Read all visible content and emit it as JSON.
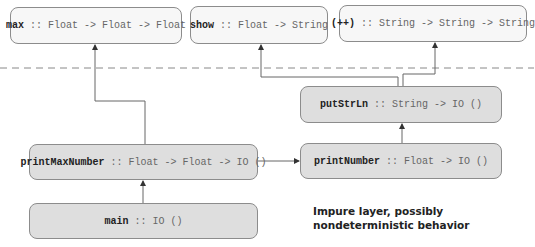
{
  "pure_layer": {
    "functions": [
      {
        "name": "max",
        "signature": " :: Float -> Float -> Float"
      },
      {
        "name": "show",
        "signature": " :: Float -> String"
      },
      {
        "name": "(++)",
        "signature": " :: String -> String -> String"
      }
    ]
  },
  "impure_layer": {
    "functions": [
      {
        "name": "putStrLn",
        "signature": " :: String -> IO ()"
      },
      {
        "name": "printMaxNumber",
        "signature": " :: Float -> Float -> IO ()"
      },
      {
        "name": "printNumber",
        "signature": " :: Float -> IO ()"
      },
      {
        "name": "main",
        "signature": " :: IO ()"
      }
    ],
    "caption_line1": "Impure layer, possibly",
    "caption_line2": "nondeterministic behavior"
  },
  "edges": [
    {
      "from": "printMaxNumber",
      "to": "max"
    },
    {
      "from": "printMaxNumber",
      "to": "printNumber"
    },
    {
      "from": "main",
      "to": "printMaxNumber"
    },
    {
      "from": "printNumber",
      "to": "putStrLn"
    },
    {
      "from": "putStrLn",
      "to": "show"
    },
    {
      "from": "putStrLn",
      "to": "(++)"
    }
  ],
  "colors": {
    "pure_fill": "#f7f7f7",
    "impure_fill": "#dedede",
    "border": "#8c8c8c",
    "line": "#666666",
    "divider": "#888888"
  }
}
